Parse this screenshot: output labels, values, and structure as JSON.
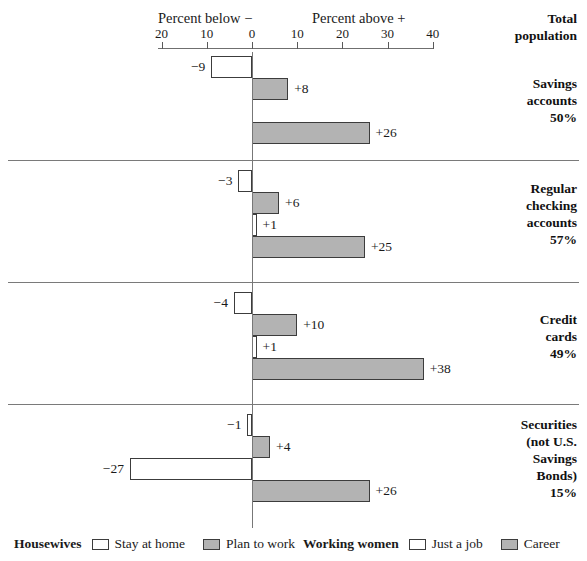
{
  "top_remnant": "",
  "axis": {
    "caption_below": "Percent below −",
    "caption_above": "Percent above +",
    "ticks": [
      {
        "label": "20",
        "value": -20
      },
      {
        "label": "10",
        "value": -10
      },
      {
        "label": "0",
        "value": 0
      },
      {
        "label": "10",
        "value": 10
      },
      {
        "label": "20",
        "value": 20
      },
      {
        "label": "30",
        "value": 30
      },
      {
        "label": "40",
        "value": 40
      }
    ],
    "header_right": "Total\npopulation",
    "header_right_line1": "Total",
    "header_right_line2": "population"
  },
  "legend": {
    "housewives_title": "Housewives",
    "housewives_items": [
      {
        "label": "Stay at home",
        "swatch": "white"
      },
      {
        "label": "Plan to work",
        "swatch": "gray"
      }
    ],
    "working_title": "Working women",
    "working_items": [
      {
        "label": "Just a job",
        "swatch": "white"
      },
      {
        "label": "Career",
        "swatch": "gray"
      }
    ]
  },
  "chart_data": {
    "type": "bar",
    "title": "",
    "subtitle": "",
    "xlabel": "Percent below − / Percent above +",
    "ylabel": "",
    "xlim": [
      -20,
      40
    ],
    "xticks": [
      -20,
      -10,
      0,
      10,
      20,
      30,
      40
    ],
    "xticklabels": [
      "20",
      "10",
      "0",
      "10",
      "20",
      "30",
      "40"
    ],
    "grid": false,
    "legend_position": "bottom",
    "orientation": "horizontal",
    "series": [
      {
        "name": "Stay at home",
        "group": "Housewives",
        "color": "#ffffff"
      },
      {
        "name": "Plan to work",
        "group": "Housewives",
        "color": "#b3b3b3"
      },
      {
        "name": "Just a job",
        "group": "Working women",
        "color": "#ffffff"
      },
      {
        "name": "Career",
        "group": "Working women",
        "color": "#b3b3b3"
      }
    ],
    "categories": [
      "Savings accounts 50%",
      "Regular checking accounts 57%",
      "Credit cards 49%",
      "Securities (not U.S. Savings Bonds) 15%"
    ],
    "groups": [
      {
        "label_lines": [
          "Savings",
          "accounts",
          "50%"
        ],
        "total_population": "50%",
        "bars": [
          {
            "series": "Stay at home",
            "value": -9,
            "label": "−9",
            "fill": "white"
          },
          {
            "series": "Plan to work",
            "value": 8,
            "label": "+8",
            "fill": "gray"
          },
          {
            "series": "Just a job",
            "value": 0,
            "label": "",
            "fill": "white"
          },
          {
            "series": "Career",
            "value": 26,
            "label": "+26",
            "fill": "gray"
          }
        ]
      },
      {
        "label_lines": [
          "Regular",
          "checking",
          "accounts",
          "57%"
        ],
        "total_population": "57%",
        "bars": [
          {
            "series": "Stay at home",
            "value": -3,
            "label": "−3",
            "fill": "white"
          },
          {
            "series": "Plan to work",
            "value": 6,
            "label": "+6",
            "fill": "gray"
          },
          {
            "series": "Just a job",
            "value": 1,
            "label": "+1",
            "fill": "white"
          },
          {
            "series": "Career",
            "value": 25,
            "label": "+25",
            "fill": "gray"
          }
        ]
      },
      {
        "label_lines": [
          "Credit",
          "cards",
          "49%"
        ],
        "total_population": "49%",
        "bars": [
          {
            "series": "Stay at home",
            "value": -4,
            "label": "−4",
            "fill": "white"
          },
          {
            "series": "Plan to work",
            "value": 10,
            "label": "+10",
            "fill": "gray"
          },
          {
            "series": "Just a job",
            "value": 1,
            "label": "+1",
            "fill": "white"
          },
          {
            "series": "Career",
            "value": 38,
            "label": "+38",
            "fill": "gray"
          }
        ]
      },
      {
        "label_lines": [
          "Securities",
          "(not U.S.",
          "Savings",
          "Bonds)",
          "15%"
        ],
        "total_population": "15%",
        "bars": [
          {
            "series": "Stay at home",
            "value": -1,
            "label": "−1",
            "fill": "white"
          },
          {
            "series": "Plan to work",
            "value": 4,
            "label": "+4",
            "fill": "gray"
          },
          {
            "series": "Just a job",
            "value": -27,
            "label": "−27",
            "fill": "white"
          },
          {
            "series": "Career",
            "value": 26,
            "label": "+26",
            "fill": "gray"
          }
        ]
      }
    ]
  }
}
